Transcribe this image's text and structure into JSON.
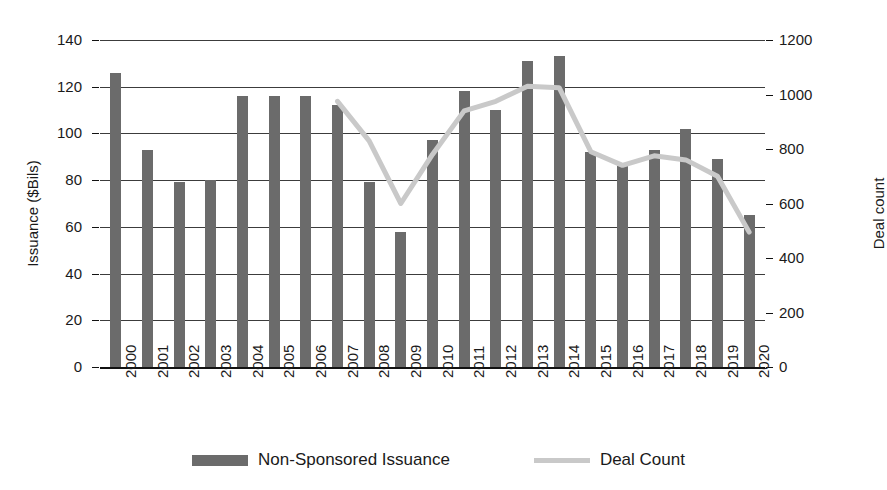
{
  "chart_data": {
    "type": "bar",
    "title": "",
    "xlabel": "",
    "ylabel": "Issuance ($Bils)",
    "y2label": "Deal count",
    "ylim": [
      0,
      140
    ],
    "y2lim": [
      0,
      1200
    ],
    "yticks": [
      0,
      20,
      40,
      60,
      80,
      100,
      120,
      140
    ],
    "y2ticks": [
      0,
      200,
      400,
      600,
      800,
      1000,
      1200
    ],
    "grid": true,
    "legend_position": "bottom",
    "categories": [
      "2000",
      "2001",
      "2002",
      "2003",
      "2004",
      "2005",
      "2006",
      "2007",
      "2008",
      "2009",
      "2010",
      "2011",
      "2012",
      "2013",
      "2014",
      "2015",
      "2016",
      "2017",
      "2018",
      "2019",
      "2020"
    ],
    "series": [
      {
        "name": "Non-Sponsored Issuance",
        "type": "bar",
        "axis": "left",
        "color": "#6b6b6b",
        "values": [
          126,
          93,
          79,
          80,
          116,
          116,
          116,
          112,
          79,
          58,
          97,
          118,
          110,
          131,
          133,
          92,
          86,
          93,
          102,
          89,
          65
        ]
      },
      {
        "name": "Deal Count",
        "type": "line",
        "axis": "right",
        "color": "#c9c9c9",
        "values": [
          null,
          null,
          null,
          null,
          null,
          null,
          null,
          975,
          830,
          600,
          780,
          940,
          975,
          1030,
          1025,
          790,
          740,
          775,
          760,
          700,
          495
        ]
      }
    ]
  },
  "legend": {
    "items": [
      {
        "label": "Non-Sponsored Issuance",
        "swatch": "bar-swatch",
        "color": "#6b6b6b"
      },
      {
        "label": "Deal Count",
        "swatch": "line-swatch",
        "color": "#c9c9c9"
      }
    ]
  },
  "axes": {
    "left_title": "Issuance ($Bils)",
    "right_title": "Deal count",
    "left_ticks": [
      "140",
      "120",
      "100",
      "80",
      "60",
      "40",
      "20",
      "0"
    ],
    "right_ticks": [
      "1200",
      "1000",
      "800",
      "600",
      "400",
      "200",
      "0"
    ]
  }
}
